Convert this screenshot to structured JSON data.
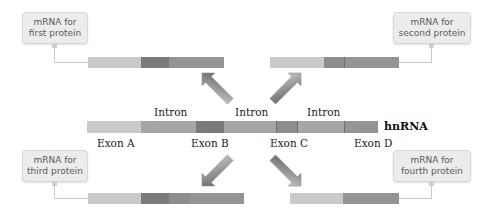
{
  "callouts": {
    "first": {
      "line1": "mRNA for",
      "line2": "first protein"
    },
    "second": {
      "line1": "mRNA for",
      "line2": "second protein"
    },
    "third": {
      "line1": "mRNA for",
      "line2": "third protein"
    },
    "fourth": {
      "line1": "mRNA for",
      "line2": "fourth protein"
    }
  },
  "hnrna": {
    "label": "hnRNA",
    "introns": [
      "Intron",
      "Intron",
      "Intron"
    ],
    "exons": [
      "Exon A",
      "Exon B",
      "Exon C",
      "Exon D"
    ]
  },
  "colors": {
    "exon_a": "#c9c9c9",
    "exon_b": "#7a7a7a",
    "exon_c": "#8d8d8d",
    "exon_d": "#949494",
    "intron": "#a6a6a6",
    "callout_bg": "#ececec"
  }
}
